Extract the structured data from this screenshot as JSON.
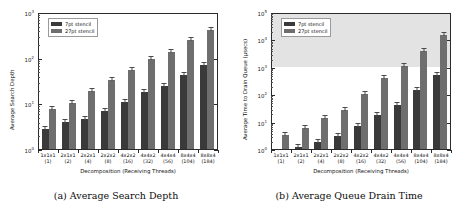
{
  "figure": {
    "panels": [
      {
        "id": "a",
        "caption": "(a) Average Search Depth",
        "ylabel": "Average Search Depth",
        "xlabel": "Decomposition (Receiving Threads)",
        "ytick_labels": [
          "10",
          "10",
          "10",
          "10"
        ],
        "ytick_exponents": [
          "0",
          "1",
          "2",
          "3"
        ],
        "legend": [
          "7pt stencil",
          "27pt stencil"
        ],
        "shaded_region": null
      },
      {
        "id": "b",
        "caption": "(b) Average Queue Drain Time",
        "ylabel": "Average Time to Drain Queue (µsecs)",
        "xlabel": "Decomposition (Receiving Threads)",
        "ytick_labels": [
          "10",
          "10",
          "10",
          "10",
          "10",
          "10"
        ],
        "ytick_exponents": [
          "0",
          "1",
          "2",
          "3",
          "4",
          "5"
        ],
        "legend": [
          "7pt stencil",
          "27pt stencil"
        ],
        "shaded_region": {
          "from": 1000,
          "to": 100000,
          "color": "#e3e3e3"
        }
      }
    ]
  },
  "colors": {
    "series_7pt": "#3a3a3a",
    "series_27pt": "#6e6e6e",
    "axis": "#2b2b2b",
    "shading": "#e3e3e3",
    "background": "#ffffff"
  },
  "chart_data": [
    {
      "type": "bar",
      "title": "(a) Average Search Depth",
      "xlabel": "Decomposition (Receiving Threads)",
      "ylabel": "Average Search Depth",
      "yscale": "log",
      "ylim": [
        1,
        1000
      ],
      "grid": false,
      "legend_position": "upper left",
      "categories": [
        "1x1x1",
        "2x1x1",
        "2x2x1",
        "2x2x2",
        "4x2x2",
        "4x4x2",
        "4x4x4",
        "8x4x4",
        "8x8x4"
      ],
      "category_sublabels": [
        "(1)",
        "(2)",
        "(4)",
        "(8)",
        "(16)",
        "(32)",
        "(56)",
        "(104)",
        "(184)"
      ],
      "series": [
        {
          "name": "7pt stencil",
          "color": "#3a3a3a",
          "values": [
            2.7,
            4.0,
            4.6,
            6.9,
            10.6,
            17.5,
            24.5,
            42.0,
            70.0
          ],
          "errors": [
            0.15,
            0.2,
            0.2,
            0.3,
            0.5,
            0.8,
            1.2,
            2.0,
            3.5
          ]
        },
        {
          "name": "27pt stencil",
          "color": "#6e6e6e",
          "values": [
            7.6,
            10.3,
            19.0,
            32.0,
            54.0,
            92.0,
            135.0,
            240.0,
            400.0
          ],
          "errors": [
            0.8,
            0.6,
            1.0,
            1.5,
            2.5,
            4.0,
            6.0,
            11.0,
            18.0
          ]
        }
      ]
    },
    {
      "type": "bar",
      "title": "(b) Average Queue Drain Time",
      "xlabel": "Decomposition (Receiving Threads)",
      "ylabel": "Average Time to Drain Queue (µsecs)",
      "yscale": "log",
      "ylim": [
        1,
        100000
      ],
      "grid": false,
      "legend_position": "upper left",
      "shaded_band": [
        1000,
        100000
      ],
      "categories": [
        "1x1x1",
        "2x1x1",
        "2x2x1",
        "2x2x2",
        "4x2x2",
        "4x4x2",
        "4x4x4",
        "8x4x4",
        "8x8x4"
      ],
      "category_sublabels": [
        "(1)",
        "(2)",
        "(4)",
        "(8)",
        "(16)",
        "(32)",
        "(56)",
        "(104)",
        "(184)"
      ],
      "series": [
        {
          "name": "7pt stencil",
          "color": "#3a3a3a",
          "values": [
            1.0,
            1.2,
            1.8,
            3.0,
            6.8,
            18.0,
            42.0,
            140.0,
            500.0
          ],
          "errors": [
            0.0,
            0.1,
            0.1,
            0.2,
            0.4,
            1.2,
            3.0,
            10.0,
            35.0
          ]
        },
        {
          "name": "27pt stencil",
          "color": "#6e6e6e",
          "values": [
            3.2,
            6.0,
            13.0,
            27.0,
            105.0,
            390.0,
            1050.0,
            3900.0,
            15000.0
          ],
          "errors": [
            0.2,
            0.4,
            0.8,
            1.8,
            7.0,
            25.0,
            70.0,
            260.0,
            1000.0
          ]
        }
      ]
    }
  ]
}
